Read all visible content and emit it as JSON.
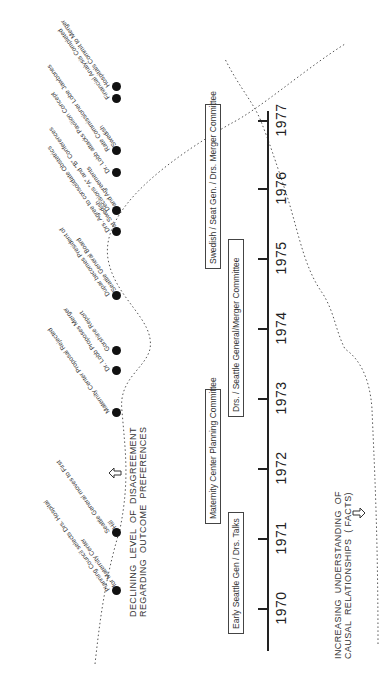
{
  "axis": {
    "years": [
      "1970",
      "1971",
      "1972",
      "1973",
      "1974",
      "1975",
      "1976",
      "1977"
    ]
  },
  "committees": [
    {
      "label": "Early Seattle Gen / Drs. Talks"
    },
    {
      "label": "Maternity Center Planning Committee"
    },
    {
      "label": "Drs. / Seattle General/Merger Committee"
    },
    {
      "label": "Swedish / Seat Gen. / Drs. Merger Committee"
    }
  ],
  "events": [
    {
      "label": "Planning Council selects Drs. Hospital\nfor Maternity Center"
    },
    {
      "label": "Seattle General moves to First\nHill"
    },
    {
      "label": "Maternity Center Proposal Rejected"
    },
    {
      "label": "Dr. Lobb Proposes Merger"
    },
    {
      "label": "Gorshine Report"
    },
    {
      "label": "Dupar becomes President of\nSeattle General Board"
    },
    {
      "label": "Drs. Agree to consolidate Obstetrics\nat Swedish"
    },
    {
      "label": "Decisions \"A\" and \"B\" Conferences\nand Agreements"
    },
    {
      "label": "Dr. Lobb attacks Pavilion Concept"
    },
    {
      "label": "Rate Commissioner Lobe Jawbones\nSwedish"
    },
    {
      "label": "Financial Analysis Completed"
    },
    {
      "label": "Hospitals Commit to Merger"
    }
  ],
  "captions": {
    "disagreement": "DECLINING  LEVEL  OF  DISAGREEMENT\nREGARDING  OUTCOME  PREFERENCES",
    "understanding": "INCREASING  UNDERSTANDING  OF\nCAUSAL  RELATIONSHIPS  ( FACTS)"
  }
}
